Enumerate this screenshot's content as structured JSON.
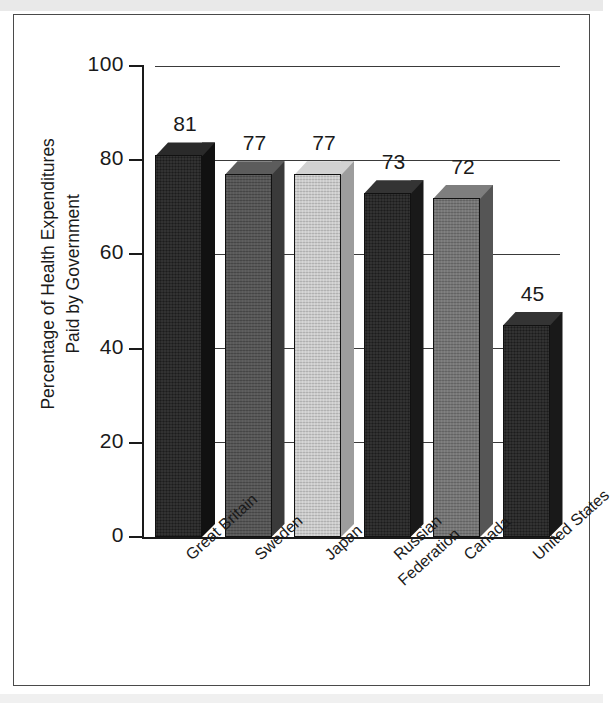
{
  "chart_data": {
    "type": "bar",
    "title": "",
    "subtitle": "",
    "xlabel": "",
    "ylabel": "Percentage of Health Expenditures\nPaid by Government",
    "ylabel_line1": "Percentage of Health Expenditures",
    "ylabel_line2": "Paid by Government",
    "categories": [
      "Great Britain",
      "Sweden",
      "Japan",
      "Russian Federation",
      "Canada",
      "United States"
    ],
    "values": [
      81,
      77,
      77,
      73,
      72,
      45
    ],
    "value_labels": [
      "81",
      "77",
      "77",
      "73",
      "72",
      "45"
    ],
    "ylim": [
      0,
      100
    ],
    "ytick_labels": [
      "0",
      "20",
      "40",
      "60",
      "80",
      "100"
    ],
    "ytick_values": [
      0,
      20,
      40,
      60,
      80,
      100
    ],
    "grid": true,
    "grid_axis": "y",
    "legend": false,
    "legend_position": "none",
    "style": "3d-bars-grayscale-scan",
    "bar_colors": [
      "#1c1c1c",
      "#4e4e4e",
      "#c2c2c2",
      "#262626",
      "#6e6e6e",
      "#262626"
    ],
    "bar_side_colors": [
      "#111111",
      "#3a3a3a",
      "#9d9d9d",
      "#191919",
      "#555555",
      "#191919"
    ],
    "bar_top_colors": [
      "#2a2a2a",
      "#5c5c5c",
      "#d2d2d2",
      "#343434",
      "#7e7e7e",
      "#343434"
    ]
  },
  "axis": {
    "y_title_line1": "Percentage of Health Expenditures",
    "y_title_line2": "Paid by Government",
    "ticks": [
      {
        "label": "100",
        "value": 100
      },
      {
        "label": "80",
        "value": 80
      },
      {
        "label": "60",
        "value": 60
      },
      {
        "label": "40",
        "value": 40
      },
      {
        "label": "20",
        "value": 20
      },
      {
        "label": "0",
        "value": 0
      }
    ]
  },
  "bars": [
    {
      "category": "Great Britain",
      "value": 81,
      "label": "81",
      "category_line1": "Great Britain",
      "category_line2": ""
    },
    {
      "category": "Sweden",
      "value": 77,
      "label": "77",
      "category_line1": "Sweden",
      "category_line2": ""
    },
    {
      "category": "Japan",
      "value": 77,
      "label": "77",
      "category_line1": "Japan",
      "category_line2": ""
    },
    {
      "category": "Russian Federation",
      "value": 73,
      "label": "73",
      "category_line1": "Russian",
      "category_line2": "Federation"
    },
    {
      "category": "Canada",
      "value": 72,
      "label": "72",
      "category_line1": "Canada",
      "category_line2": ""
    },
    {
      "category": "United States",
      "value": 45,
      "label": "45",
      "category_line1": "United States",
      "category_line2": ""
    }
  ],
  "colors": {
    "frame_border": "#4a4a4a",
    "axis": "#1a1a1a",
    "grid": "#3a3a3a",
    "text": "#1a1a1a",
    "background": "#ffffff",
    "scan_band": "#e9e9e9"
  }
}
